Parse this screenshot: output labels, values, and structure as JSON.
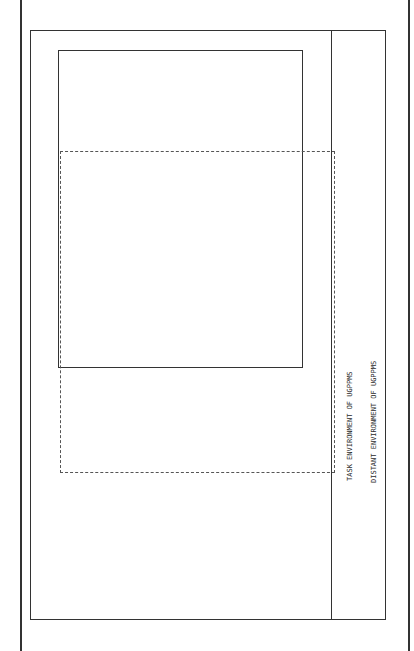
{
  "diagram": {
    "system_title": "UGPPMS",
    "outputs": {
      "header": "OUTPUT AND\nOUTCOME\nPERFORMANCE:",
      "items": [
        "Representative-\nness",
        "Responsiveness",
        "Accountability",
        "Political\nNeutrality",
        "Legal\nConformity",
        "Productivity",
        "Competence",
        "Job\nSatisfaction &\nSecurity",
        "Turnover",
        "Level,Quality &\nDistributional\nEquity of\nServices\netc."
      ]
    },
    "subsystems": [
      {
        "title": "Local Government Political Control System(with Actors)",
        "body": "Local courts - Chief Executive Officer -City Council"
      },
      {
        "title": "Manpower Policy Control Sub-System (with Actors)",
        "columns": [
          [
            "Civil Service\nCommission",
            "EEO/AA Office"
          ],
          [
            "Personnel\nOffice",
            "Department Heads"
          ],
          [
            "Finance/Budget\nOffice",
            "Manpower Programs\nOffice"
          ],
          [
            "Labor\nRelations"
          ]
        ]
      },
      {
        "title": "Central Personnel Administration Support Sub-System",
        "columns": [
          [
            "Task Analysis",
            "Position\nClassification",
            "Career System"
          ],
          [
            "Manpower\nPlanning &\nForecasting",
            "Research"
          ],
          [
            "Information systems &\nRecords",
            "Monitoring legal\nEnvironment"
          ]
        ]
      },
      {
        "title": "Operational Personnel Sub-System (with Functions)",
        "columns": [
          [
            "Recruitment &\nOutreach",
            "Selection via\nexams,test\nvalidation,etc."
          ],
          [
            "Placement",
            "Career Mobility\nvia transfers\n& promotions",
            "Health & Safety"
          ],
          [
            "Training & Development",
            "Performance Evaluation",
            "Compensation/Motivation",
            "Labor Relations &\nCollective Bargaining"
          ]
        ]
      }
    ],
    "demands": {
      "header": "DEMANDS:",
      "subheader": "Federal Laws\nand Rules:",
      "items": [
        "Equal\nEmployment\nOpportunity\n& Affirmative\nAction(EEO/AA)",
        "Merit Norms\nof Inter-\nGovernmental\nPersonnel Law\n(IPA)",
        "Manpower\nPolicy(CETA,\netc.)",
        "Federal Grant\nRequirements\netc.",
        "State Laws &\nPrograms",
        "Local Unions",
        "Political\nPressures"
      ],
      "resource_header": "RESOURCE\nSUPPORTS:",
      "resource_body": "Labor Pool\nTechnology,\nEconomy,etc."
    },
    "environment": {
      "task": "TASK ENVIRONMENT OF UGPPMS",
      "distant": "DISTANT ENVIRONMENT OF UGPPMS"
    },
    "legend": {
      "arrow_label": "Relations of\nInterdependency",
      "dash_label": "System boundary"
    }
  }
}
